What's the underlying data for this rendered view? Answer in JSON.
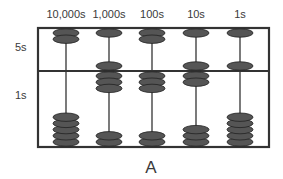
{
  "figure": {
    "caption": "A",
    "column_labels": [
      "10,000s",
      "1,000s",
      "100s",
      "10s",
      "1s"
    ],
    "row_labels": {
      "upper": "5s",
      "lower": "1s"
    },
    "colors": {
      "frame": "#333333",
      "bead": "#555555",
      "bead_stroke": "#222222",
      "text": "#3a3a3a"
    },
    "columns": [
      {
        "place": "10,000s",
        "upper_beads_at_bar": 0,
        "upper_beads_total": 2,
        "lower_beads_at_bar": 0,
        "lower_beads_total": 5,
        "digit": 0
      },
      {
        "place": "1,000s",
        "upper_beads_at_bar": 1,
        "upper_beads_total": 2,
        "lower_beads_at_bar": 3,
        "lower_beads_total": 5,
        "digit": 8
      },
      {
        "place": "100s",
        "upper_beads_at_bar": 0,
        "upper_beads_total": 2,
        "lower_beads_at_bar": 3,
        "lower_beads_total": 5,
        "digit": 3
      },
      {
        "place": "10s",
        "upper_beads_at_bar": 1,
        "upper_beads_total": 2,
        "lower_beads_at_bar": 2,
        "lower_beads_total": 5,
        "digit": 7
      },
      {
        "place": "1s",
        "upper_beads_at_bar": 1,
        "upper_beads_total": 2,
        "lower_beads_at_bar": 0,
        "lower_beads_total": 5,
        "digit": 5
      }
    ],
    "represented_value": "08375"
  }
}
